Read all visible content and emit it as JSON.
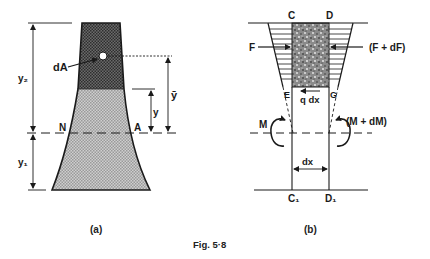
{
  "figure": {
    "caption": "Fig. 5·8",
    "colors": {
      "ink": "#1a1a1a",
      "dark_fill": "#555555",
      "light_fill": "#bdbdbd",
      "speckle": "#6a6a6a"
    }
  },
  "panel_a": {
    "label": "(a)",
    "labels": {
      "dA": "dA",
      "y2": "y₂",
      "y1": "y₁",
      "y": "y",
      "ybar": "ȳ",
      "N": "N",
      "A": "A"
    }
  },
  "panel_b": {
    "label": "(b)",
    "labels": {
      "C": "C",
      "D": "D",
      "E": "E",
      "G": "G",
      "F": "F",
      "F_dF": "(F + dF)",
      "q_dx": "q dx",
      "M": "M",
      "M_dM": "(M + dM)",
      "dx": "dx",
      "C1": "C₁",
      "D1": "D₁"
    }
  }
}
